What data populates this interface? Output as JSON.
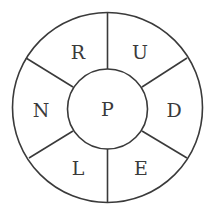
{
  "diagram": {
    "type": "letter-wheel",
    "center_letter": "P",
    "segments": [
      {
        "position": "top-left",
        "letter": "R"
      },
      {
        "position": "top-right",
        "letter": "U"
      },
      {
        "position": "right",
        "letter": "D"
      },
      {
        "position": "bottom-right",
        "letter": "E"
      },
      {
        "position": "bottom-left",
        "letter": "L"
      },
      {
        "position": "left",
        "letter": "N"
      }
    ],
    "colors": {
      "stroke": "#3a3a3a",
      "background": "#ffffff"
    }
  }
}
